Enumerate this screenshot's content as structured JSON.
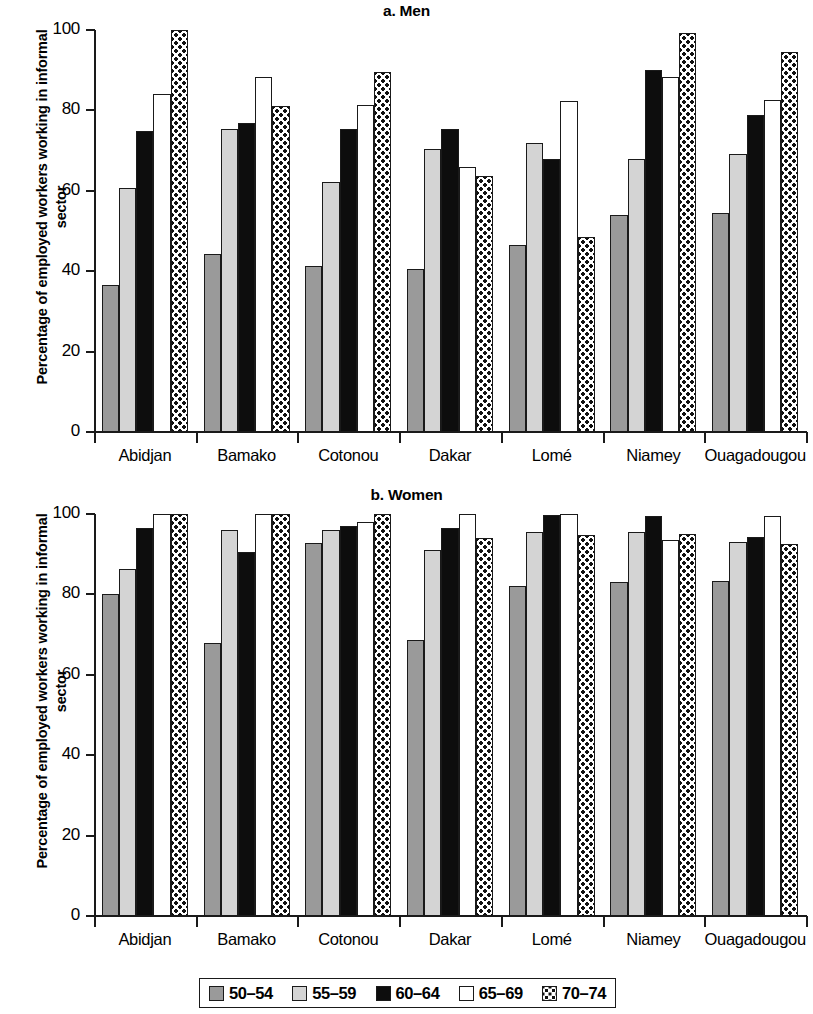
{
  "legend": {
    "items": [
      {
        "label": "50–54",
        "color": "#9a9a9a",
        "pattern": "solid-gray"
      },
      {
        "label": "55–59",
        "color": "#d4d4d4",
        "pattern": "solid-light-gray"
      },
      {
        "label": "60–64",
        "color": "#0d0d0d",
        "pattern": "solid-black"
      },
      {
        "label": "65–69",
        "color": "#ffffff",
        "pattern": "open-white"
      },
      {
        "label": "70–74",
        "color": "#ffffff",
        "pattern": "checkered-dots"
      }
    ]
  },
  "chart_data": [
    {
      "type": "bar",
      "title": "a. Men",
      "xlabel": "",
      "ylabel": "Percentage of employed workers working in informal sector",
      "ylim": [
        0,
        100
      ],
      "yticks": [
        0,
        20,
        40,
        60,
        80,
        100
      ],
      "grid": false,
      "legend_position": "bottom",
      "categories": [
        "Abidjan",
        "Bamako",
        "Cotonou",
        "Dakar",
        "Lomé",
        "Niamey",
        "Ouagadougou"
      ],
      "series": [
        {
          "name": "50–54",
          "values": [
            36.5,
            44.3,
            41.3,
            40.5,
            46.6,
            53.9,
            54.6
          ]
        },
        {
          "name": "55–59",
          "values": [
            60.8,
            75.3,
            62.2,
            70.5,
            71.8,
            67.9,
            69.1
          ]
        },
        {
          "name": "60–64",
          "values": [
            74.9,
            76.8,
            75.5,
            75.4,
            67.9,
            90.1,
            78.8
          ]
        },
        {
          "name": "65–69",
          "values": [
            84.2,
            88.3,
            81.3,
            66.0,
            82.4,
            88.4,
            82.7
          ]
        },
        {
          "name": "70–74",
          "values": [
            100.0,
            81.2,
            89.6,
            63.8,
            48.4,
            99.3,
            94.5
          ]
        }
      ]
    },
    {
      "type": "bar",
      "title": "b. Women",
      "xlabel": "",
      "ylabel": "Percentage of employed workers working in informal sector",
      "ylim": [
        0,
        100
      ],
      "yticks": [
        0,
        20,
        40,
        60,
        80,
        100
      ],
      "grid": false,
      "legend_position": "bottom",
      "categories": [
        "Abidjan",
        "Bamako",
        "Cotonou",
        "Dakar",
        "Lomé",
        "Niamey",
        "Ouagadougou"
      ],
      "series": [
        {
          "name": "50–54",
          "values": [
            80.0,
            67.8,
            92.8,
            68.6,
            82.1,
            83.0,
            83.3
          ]
        },
        {
          "name": "55–59",
          "values": [
            86.3,
            96.1,
            96.1,
            91.0,
            95.6,
            95.5,
            93.0
          ]
        },
        {
          "name": "60–64",
          "values": [
            96.5,
            90.5,
            96.9,
            96.5,
            99.8,
            99.5,
            94.4
          ]
        },
        {
          "name": "65–69",
          "values": [
            100.0,
            100.0,
            98.0,
            100.0,
            100.0,
            93.5,
            99.6
          ]
        },
        {
          "name": "70–74",
          "values": [
            100.0,
            100.0,
            100.0,
            94.0,
            94.8,
            95.0,
            92.5
          ]
        }
      ]
    }
  ]
}
